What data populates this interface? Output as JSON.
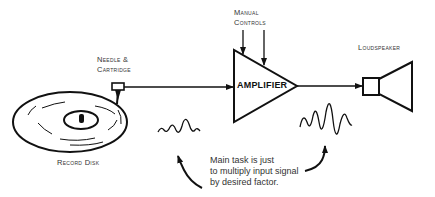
{
  "diagram": {
    "labels": {
      "manual_controls_line1": "Manual",
      "manual_controls_line2": "Controls",
      "needle_line1": "Needle &",
      "needle_line2": "Cartridge",
      "loudspeaker": "Loudspeaker",
      "record_disk": "Record Disk",
      "amplifier": "AMPLIFIER"
    },
    "caption": {
      "line1": "Main task is just",
      "line2": "to multiply input signal",
      "line3": "by desired factor."
    },
    "colors": {
      "stroke": "#111111",
      "text": "#333333",
      "background": "#ffffff"
    }
  }
}
